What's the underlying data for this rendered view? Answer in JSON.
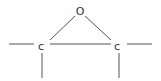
{
  "diagram": {
    "atoms": [
      {
        "id": "O",
        "label": "O",
        "x": 80,
        "y": 11
      },
      {
        "id": "C1",
        "label": "c",
        "x": 41,
        "y": 46
      },
      {
        "id": "C2",
        "label": "c",
        "x": 117,
        "y": 46
      }
    ],
    "colors": {
      "line": "#555555",
      "text": "#333333",
      "background": "#ffffff"
    }
  }
}
